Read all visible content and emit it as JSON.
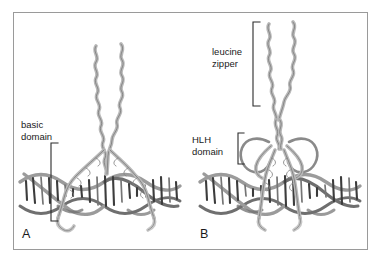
{
  "figure": {
    "title": "",
    "background_color": "#ffffff",
    "border_color": "#9a9a9a",
    "ribbon_color": "#d2d2d2",
    "dna_color": "#3c3c3c"
  },
  "panels": [
    {
      "letter": "A",
      "letter_position": {
        "x": 22,
        "y": 238
      },
      "structure": "leucine zipper bound to DNA",
      "annotations": [
        {
          "id": "basic-domain",
          "line1": "basic",
          "line2": "domain",
          "text_x": 21,
          "text_y1": 128,
          "text_y2": 140,
          "bracket": {
            "x": 51,
            "y_top": 143,
            "y_bottom": 221,
            "tick": 7,
            "opens": "right"
          }
        }
      ]
    },
    {
      "letter": "B",
      "letter_position": {
        "x": 200,
        "y": 238
      },
      "structure": "helix-loop-helix with leucine zipper bound to DNA",
      "annotations": [
        {
          "id": "leucine-zipper",
          "line1": "leucine",
          "line2": "zipper",
          "text_x": 212,
          "text_y1": 55,
          "text_y2": 67,
          "bracket": {
            "x": 253,
            "y_top": 22,
            "y_bottom": 106,
            "tick": 7,
            "opens": "right"
          }
        },
        {
          "id": "hlh-domain",
          "line1": "HLH",
          "line2": "domain",
          "text_x": 192,
          "text_y1": 143,
          "text_y2": 155,
          "bracket": {
            "x": 238,
            "y_top": 133,
            "y_bottom": 164,
            "tick": 6,
            "opens": "right"
          }
        }
      ]
    }
  ]
}
